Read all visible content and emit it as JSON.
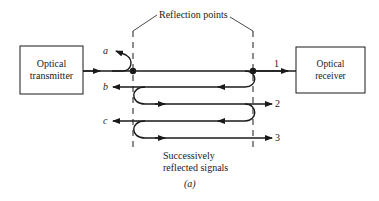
{
  "diagram": {
    "title_label": "Reflection points",
    "transmitter": {
      "line1": "Optical",
      "line2": "transmitter"
    },
    "receiver": {
      "line1": "Optical",
      "line2": "receiver"
    },
    "signals": {
      "a": "a",
      "b": "b",
      "c": "c",
      "s1": "1",
      "s2": "2",
      "s3": "3"
    },
    "bottom_label": {
      "line1": "Successively",
      "line2": "reflected signals"
    },
    "caption": "(a)"
  }
}
